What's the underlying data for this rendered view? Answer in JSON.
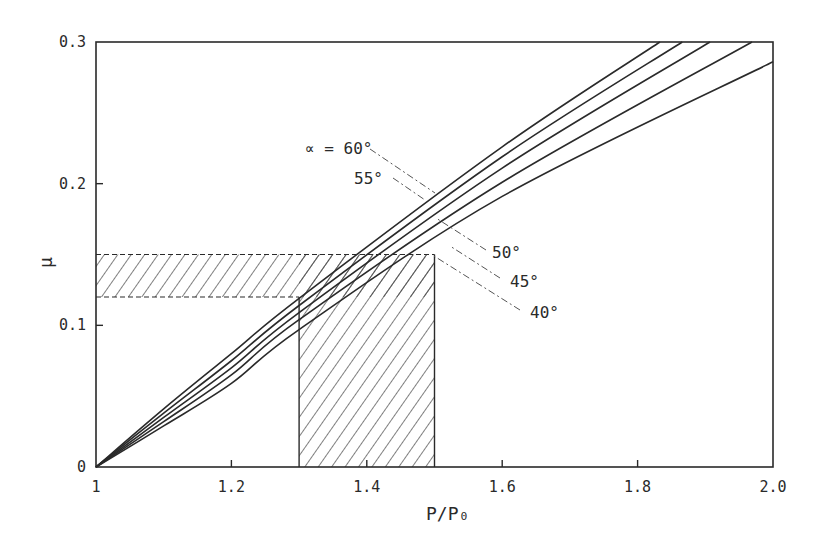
{
  "chart_data": {
    "type": "line",
    "title": "",
    "xlabel": "P/P₀",
    "ylabel": "μ",
    "xlim": [
      1.0,
      2.0
    ],
    "ylim": [
      0.0,
      0.3
    ],
    "grid": false,
    "legend_position": "inline-labels",
    "x_ticks": [
      1.0,
      1.2,
      1.4,
      1.6,
      1.8,
      2.0
    ],
    "x_tick_labels": [
      "1",
      "1.2",
      "1.4",
      "1.6",
      "1.8",
      "2.0"
    ],
    "y_ticks": [
      0.0,
      0.1,
      0.2,
      0.3
    ],
    "y_tick_labels": [
      "0",
      "0.1",
      "0.2",
      "0.3"
    ],
    "series": [
      {
        "name": "α = 60°",
        "label": "∝ = 60°",
        "x": [
          1.0,
          1.1,
          1.2,
          1.3,
          1.6,
          1.833
        ],
        "values": [
          0.0,
          0.041,
          0.08,
          0.119,
          0.226,
          0.3
        ]
      },
      {
        "name": "α = 55°",
        "label": "55°",
        "x": [
          1.0,
          1.1,
          1.2,
          1.3,
          1.6,
          1.866
        ],
        "values": [
          0.0,
          0.038,
          0.075,
          0.114,
          0.219,
          0.3
        ]
      },
      {
        "name": "α = 50°",
        "label": "50°",
        "x": [
          1.0,
          1.1,
          1.2,
          1.3,
          1.6,
          1.907
        ],
        "values": [
          0.0,
          0.035,
          0.07,
          0.109,
          0.211,
          0.3
        ]
      },
      {
        "name": "α = 45°",
        "label": "45°",
        "x": [
          1.0,
          1.1,
          1.2,
          1.3,
          1.6,
          1.969
        ],
        "values": [
          0.0,
          0.032,
          0.065,
          0.104,
          0.201,
          0.3
        ]
      },
      {
        "name": "α = 40°",
        "label": "40°",
        "x": [
          1.0,
          1.1,
          1.2,
          1.3,
          1.6,
          2.0
        ],
        "values": [
          0.0,
          0.029,
          0.059,
          0.097,
          0.191,
          0.286
        ]
      }
    ],
    "annotations": [
      {
        "type": "hatched-band-horizontal",
        "y_range": [
          0.12,
          0.15
        ],
        "x_range": [
          1.0,
          1.5
        ]
      },
      {
        "type": "hatched-band-vertical",
        "x_range": [
          1.3,
          1.5
        ],
        "y_range": [
          0.0,
          0.15
        ]
      }
    ],
    "label_positions": [
      {
        "series": "α = 60°",
        "text_x": 305,
        "text_y": 154,
        "leader": [
          [
            370,
            149
          ],
          [
            435,
            193
          ]
        ]
      },
      {
        "series": "α = 55°",
        "text_x": 354,
        "text_y": 184,
        "leader": [
          [
            393,
            178
          ],
          [
            425,
            200
          ]
        ]
      },
      {
        "series": "α = 50°",
        "text_x": 492,
        "text_y": 258,
        "leader": [
          [
            486,
            250
          ],
          [
            436,
            218
          ]
        ]
      },
      {
        "series": "α = 45°",
        "text_x": 510,
        "text_y": 287,
        "leader": [
          [
            500,
            278
          ],
          [
            450,
            246
          ]
        ]
      },
      {
        "series": "α = 40°",
        "text_x": 530,
        "text_y": 318,
        "leader": [
          [
            520,
            310
          ],
          [
            434,
            256
          ]
        ]
      }
    ],
    "colors": {
      "line": "#2a2a2a",
      "hatch": "#3a3a3a",
      "background": "#ffffff"
    }
  }
}
